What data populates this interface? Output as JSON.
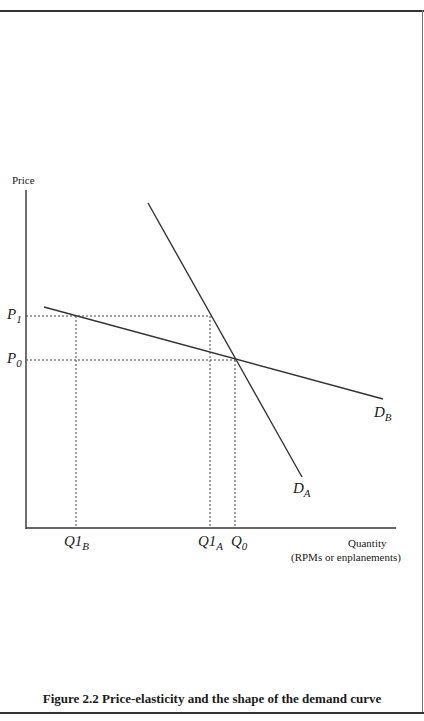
{
  "figure": {
    "caption": "Figure 2.2  Price-elasticity and the shape of the demand curve"
  },
  "axes": {
    "y_label": "Price",
    "x_label_line1": "Quantity",
    "x_label_line2": "(RPMs or enplanements)"
  },
  "price_labels": {
    "p1": {
      "main": "P",
      "sub": "1"
    },
    "p0": {
      "main": "P",
      "sub": "0"
    }
  },
  "quantity_labels": {
    "q1b": {
      "main": "Q1",
      "sub": "B"
    },
    "q1a": {
      "main": "Q1",
      "sub": "A"
    },
    "q0": {
      "main": "Q",
      "sub": "0"
    }
  },
  "curve_labels": {
    "da": {
      "main": "D",
      "sub": "A"
    },
    "db": {
      "main": "D",
      "sub": "B"
    }
  },
  "colors": {
    "line": "#333333",
    "dashed": "#444444"
  }
}
